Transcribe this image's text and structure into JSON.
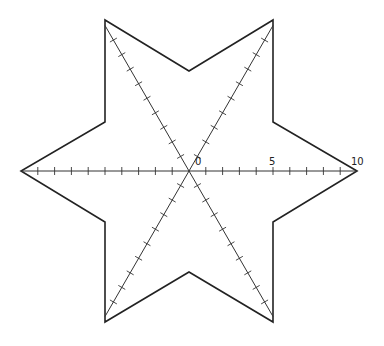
{
  "diagram": {
    "shape": "six-pointed-star",
    "stroke_color": "#222222",
    "axis_color": "#333333",
    "center": [
      189,
      171
    ],
    "unit_px": 16.8,
    "axis_range": [
      -10,
      10
    ],
    "outer_vertices": [
      [
        357,
        171
      ],
      [
        273,
        20
      ],
      [
        105,
        20
      ],
      [
        21,
        171
      ],
      [
        105,
        322
      ],
      [
        273,
        322
      ]
    ],
    "inner_vertices": [
      [
        273,
        122
      ],
      [
        189,
        71
      ],
      [
        105,
        122
      ],
      [
        105,
        222
      ],
      [
        189,
        272
      ],
      [
        273,
        222
      ]
    ],
    "axes": [
      "horizontal",
      "60deg",
      "120deg"
    ],
    "labels": [
      {
        "text": "0",
        "x": 195,
        "y": 157
      },
      {
        "text": "5",
        "x": 269,
        "y": 157
      },
      {
        "text": "10",
        "x": 351,
        "y": 157
      }
    ]
  }
}
